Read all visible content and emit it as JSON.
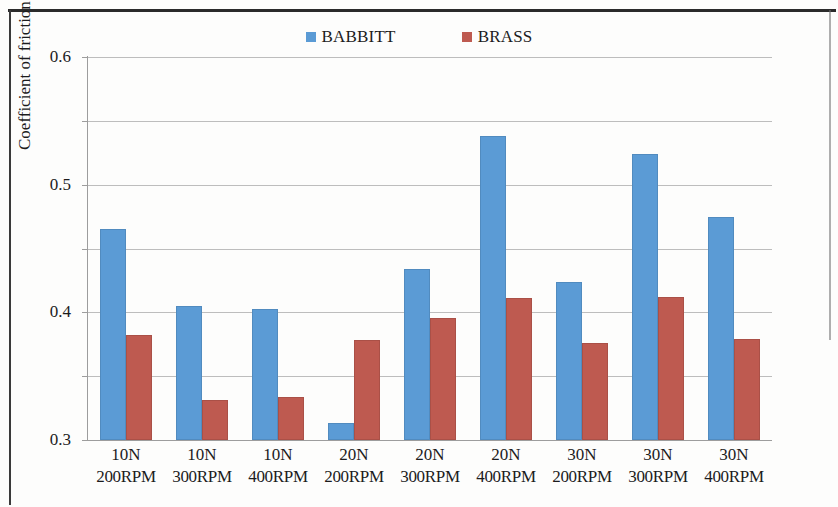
{
  "chart_data": {
    "type": "bar",
    "title": "",
    "subtitle": "",
    "xlabel": "",
    "ylabel": "Coefficient of friction",
    "ylim": [
      0,
      0.6
    ],
    "ytick_labels": [
      "0.6",
      "0.5",
      "0.4",
      "0.3",
      "0.2",
      "0.1",
      "0"
    ],
    "ytick_values": [
      0.6,
      0.5,
      0.4,
      0.3,
      0.2,
      0.1,
      0
    ],
    "grid": "horizontal",
    "legend_position": "top-center",
    "categories": [
      "10N 200RPM",
      "10N 300RPM",
      "10N 400RPM",
      "20N 200RPM",
      "20N 300RPM",
      "20N 400RPM",
      "30N 200RPM",
      "30N 300RPM",
      "30N 400RPM"
    ],
    "category_lines": [
      {
        "load": "10N",
        "speed": "200RPM"
      },
      {
        "load": "10N",
        "speed": "300RPM"
      },
      {
        "load": "10N",
        "speed": "400RPM"
      },
      {
        "load": "20N",
        "speed": "200RPM"
      },
      {
        "load": "20N",
        "speed": "300RPM"
      },
      {
        "load": "20N",
        "speed": "400RPM"
      },
      {
        "load": "30N",
        "speed": "200RPM"
      },
      {
        "load": "30N",
        "speed": "300RPM"
      },
      {
        "load": "30N",
        "speed": "400RPM"
      }
    ],
    "series": [
      {
        "name": "BABBITT",
        "color": "#5B9BD5",
        "values": [
          0.33,
          0.21,
          0.205,
          0.027,
          0.268,
          0.477,
          0.248,
          0.448,
          0.35
        ]
      },
      {
        "name": "BRASS",
        "color": "#BE5A50",
        "values": [
          0.165,
          0.063,
          0.068,
          0.157,
          0.191,
          0.223,
          0.152,
          0.224,
          0.158
        ]
      }
    ]
  },
  "legend": {
    "entries": [
      {
        "label": "BABBITT",
        "color": "#5B9BD5"
      },
      {
        "label": "BRASS",
        "color": "#BE5A50"
      }
    ]
  }
}
